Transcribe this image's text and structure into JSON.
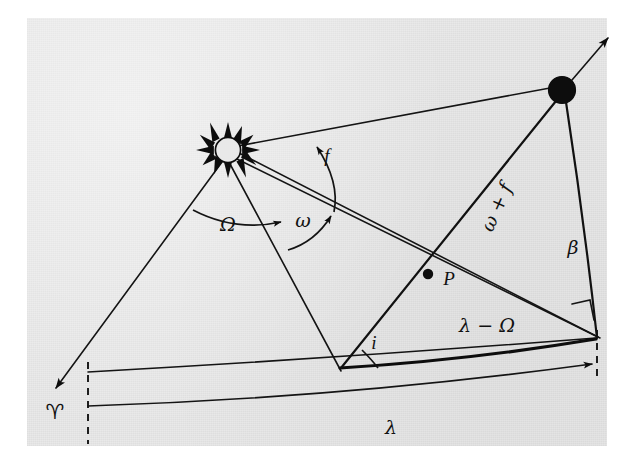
{
  "figure": {
    "background_color": "#e9e9e9",
    "ink_color": "#111111",
    "page_color": "#ffffff"
  },
  "labels": {
    "ascending_node_longitude": "Ω",
    "argument_of_perihelion": "ω",
    "true_anomaly": "f",
    "argument_plus_anomaly": "ω + f",
    "ecliptic_latitude": "β",
    "ecliptic_longitude": "λ",
    "longitude_minus_node": "λ − Ω",
    "inclination": "i",
    "perihelion_point": "P",
    "vernal_equinox": "♈"
  },
  "bodies": {
    "sun": {
      "name": "Sun",
      "cx": 228,
      "cy": 150,
      "radius": 13,
      "rays": 12
    },
    "planet": {
      "name": "Planet",
      "cx": 562,
      "cy": 90,
      "radius": 13,
      "phase": "crescent-left"
    },
    "perihelion": {
      "name": "P",
      "cx": 428,
      "cy": 274,
      "radius": 5
    }
  },
  "nodes": {
    "ascending_node": {
      "x": 340,
      "y": 368
    },
    "vernal_point": {
      "x": 52,
      "y": 392
    },
    "foot_of_latitude": {
      "x": 596,
      "y": 338
    },
    "lambda_arrow_tip": {
      "x": 588,
      "y": 364
    }
  },
  "label_positions": {
    "omega_big": {
      "x": 228,
      "y": 226
    },
    "omega_small": {
      "x": 303,
      "y": 222
    },
    "f": {
      "x": 327,
      "y": 158
    },
    "omega_plus_f": {
      "x": 498,
      "y": 208,
      "rotation": -66
    },
    "beta": {
      "x": 573,
      "y": 249
    },
    "lambda": {
      "x": 391,
      "y": 428
    },
    "lambda_minus_omega": {
      "x": 487,
      "y": 327
    },
    "i": {
      "x": 374,
      "y": 345
    },
    "P": {
      "x": 449,
      "y": 281
    },
    "aries": {
      "x": 55,
      "y": 413
    }
  }
}
